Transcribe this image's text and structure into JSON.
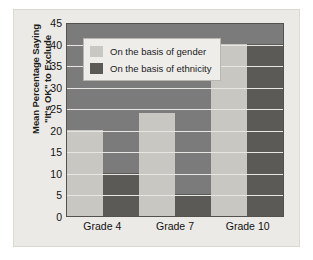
{
  "chart_data": {
    "type": "bar",
    "title": "",
    "xlabel": "",
    "ylabel_lines": [
      "Mean Percentage Saying",
      "\"It's OK\" to Exclude"
    ],
    "ylabel": "Mean Percentage Saying \"It's OK\" to Exclude",
    "categories": [
      "Grade 4",
      "Grade 7",
      "Grade 10"
    ],
    "series": [
      {
        "name": "On the basis of gender",
        "values": [
          20,
          24,
          40
        ],
        "color": "#c9c7c2"
      },
      {
        "name": "On the basis of ethnicity",
        "values": [
          10,
          5,
          40
        ],
        "color": "#5c5a57"
      }
    ],
    "ylim": [
      0,
      45
    ],
    "yticks": [
      0,
      5,
      10,
      15,
      20,
      25,
      30,
      35,
      40,
      45
    ],
    "ytick_labels": [
      "0",
      "5",
      "10",
      "15",
      "20",
      "25",
      "30",
      "35",
      "40",
      "45"
    ],
    "grid": true,
    "grid_axis": "y",
    "legend_position": "upper left",
    "plot_background": "#7b7b7b",
    "figure_background": "#eceae6",
    "gridline_color": "#e8e6e2"
  },
  "legend": {
    "items": [
      {
        "label": "On the basis of gender"
      },
      {
        "label": "On the basis of ethnicity"
      }
    ]
  }
}
